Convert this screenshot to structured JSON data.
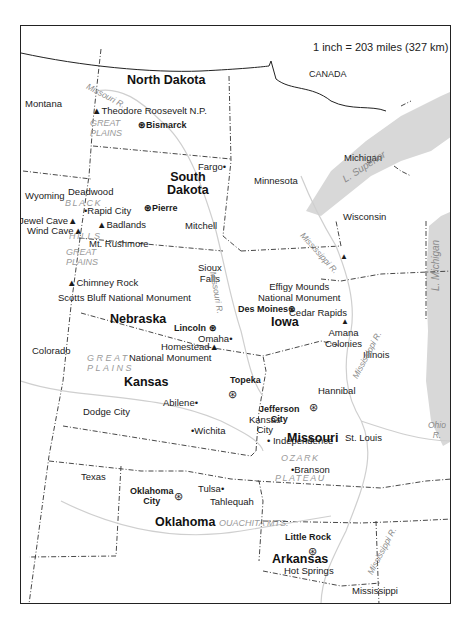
{
  "map": {
    "scale": "1 inch = 203 miles (327 km)",
    "countries": [
      {
        "name": "CANADA"
      }
    ],
    "states_primary": [
      {
        "name": "North Dakota"
      },
      {
        "name": "South\nDakota"
      },
      {
        "name": "Nebraska"
      },
      {
        "name": "Kansas"
      },
      {
        "name": "Iowa"
      },
      {
        "name": "Missouri"
      },
      {
        "name": "Oklahoma"
      },
      {
        "name": "Arkansas"
      }
    ],
    "states_neighbor": [
      {
        "name": "Montana"
      },
      {
        "name": "Wyoming"
      },
      {
        "name": "Colorado"
      },
      {
        "name": "Texas"
      },
      {
        "name": "Minnesota"
      },
      {
        "name": "Wisconsin"
      },
      {
        "name": "Michigan"
      },
      {
        "name": "Illinois"
      },
      {
        "name": "Mississippi"
      },
      {
        "name": "Louisiana"
      }
    ],
    "capitals": [
      {
        "name": "Bismarck"
      },
      {
        "name": "Pierre"
      },
      {
        "name": "Lincoln"
      },
      {
        "name": "Des Moines"
      },
      {
        "name": "Topeka"
      },
      {
        "name": "Jefferson\nCity"
      },
      {
        "name": "Oklahoma\nCity"
      },
      {
        "name": "Little Rock"
      }
    ],
    "cities": [
      {
        "name": "Fargo"
      },
      {
        "name": "Deadwood"
      },
      {
        "name": "Rapid City"
      },
      {
        "name": "Mitchell"
      },
      {
        "name": "Sioux\nFalls"
      },
      {
        "name": "Omaha"
      },
      {
        "name": "Cedar Rapids"
      },
      {
        "name": "Kansas\nCity"
      },
      {
        "name": "Independence"
      },
      {
        "name": "Hannibal"
      },
      {
        "name": "St. Louis"
      },
      {
        "name": "Abilene"
      },
      {
        "name": "Dodge City"
      },
      {
        "name": "Wichita"
      },
      {
        "name": "Branson"
      },
      {
        "name": "Tulsa"
      },
      {
        "name": "Tahlequah"
      },
      {
        "name": "Hot Springs"
      }
    ],
    "landmarks": [
      {
        "name": "Theodore Roosevelt N.P."
      },
      {
        "name": "Jewel Cave"
      },
      {
        "name": "Wind Cave"
      },
      {
        "name": "Badlands"
      },
      {
        "name": "Mt. Rushmore"
      },
      {
        "name": "Chimney Rock"
      },
      {
        "name": "Scotts Bluff National Monument"
      },
      {
        "name": "Effigy Mounds\nNational Monument"
      },
      {
        "name": "Amana\nColonies"
      },
      {
        "name": "Homestead"
      },
      {
        "name": "National Monument"
      }
    ],
    "physical": [
      {
        "name": "GREAT\nPLAINS"
      },
      {
        "name": "BLACK"
      },
      {
        "name": "HILLS"
      },
      {
        "name": "GREAT\nPLAINS"
      },
      {
        "name": "GREAT\nPLAINS"
      },
      {
        "name": "OZARK"
      },
      {
        "name": "PLATEAU"
      },
      {
        "name": "OUACHITA MTS."
      }
    ],
    "water": [
      {
        "name": "Missouri R."
      },
      {
        "name": "Missouri R."
      },
      {
        "name": "Mississippi R."
      },
      {
        "name": "Mississippi R."
      },
      {
        "name": "Mississippi R."
      },
      {
        "name": "L. Superior"
      },
      {
        "name": "L. Michigan"
      },
      {
        "name": "Ohio\nR."
      }
    ],
    "colors": {
      "border": "#222222",
      "water": "#d4d4d4",
      "river_label": "#8a8a8a",
      "physical_label": "#9a9a9a"
    }
  }
}
